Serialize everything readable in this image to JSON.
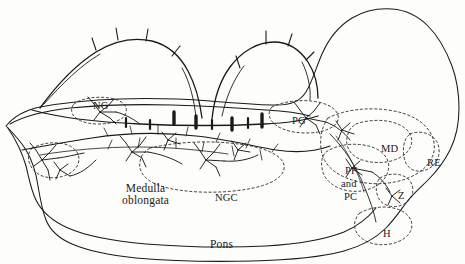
{
  "figure": {
    "type": "neuroanatomical-sagittal-schematic",
    "background_color": "#fdfdfb",
    "ink_color": "#1a1a1a",
    "description_regions": [
      "brainstem outline",
      "reticular formation nuclei",
      "neuron cell bodies with dendrites and axons"
    ]
  },
  "labels": [
    {
      "id": "ng",
      "text": "NG",
      "x": 93,
      "y": 100,
      "size": "md"
    },
    {
      "id": "pg",
      "text": "PG",
      "x": 292,
      "y": 115,
      "size": "md"
    },
    {
      "id": "md",
      "text": "MD",
      "x": 381,
      "y": 143,
      "size": "md"
    },
    {
      "id": "re",
      "text": "RE",
      "x": 427,
      "y": 157,
      "size": "md"
    },
    {
      "id": "pf",
      "text": "PF",
      "x": 345,
      "y": 165,
      "size": "md"
    },
    {
      "id": "and",
      "text": "and",
      "x": 341,
      "y": 178,
      "size": "md"
    },
    {
      "id": "pc",
      "text": "PC",
      "x": 344,
      "y": 191,
      "size": "md"
    },
    {
      "id": "z",
      "text": "Z",
      "x": 398,
      "y": 190,
      "size": "md"
    },
    {
      "id": "h",
      "text": "H",
      "x": 383,
      "y": 228,
      "size": "md"
    },
    {
      "id": "ngc",
      "text": "NGC",
      "x": 215,
      "y": 192,
      "size": "md"
    },
    {
      "id": "medulla",
      "text": "Medulla\noblongata",
      "x": 122,
      "y": 182,
      "size": "lg"
    },
    {
      "id": "pons",
      "text": "Pons",
      "x": 210,
      "y": 238,
      "size": "lg"
    }
  ]
}
